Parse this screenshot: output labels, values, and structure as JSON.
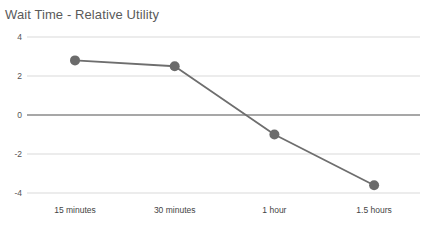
{
  "chart_data": {
    "type": "line",
    "title": "Wait Time - Relative Utility",
    "xlabel": "",
    "ylabel": "",
    "categories": [
      "15 minutes",
      "30 minutes",
      "1 hour",
      "1.5 hours"
    ],
    "values": [
      2.8,
      2.5,
      -1.0,
      -3.6
    ],
    "series": [
      {
        "name": "Relative Utility",
        "values": [
          2.8,
          2.5,
          -1.0,
          -3.6
        ]
      }
    ],
    "ylim": [
      -4,
      4
    ],
    "yticks": [
      4,
      2,
      0,
      -2,
      -4
    ],
    "ytick_labels": [
      "4",
      "2",
      "0",
      "-2",
      "-4"
    ],
    "grid": true,
    "legend": "none",
    "colors": {
      "line": "#6e6e6e",
      "marker": "#6b6b6b",
      "gridline": "#d9d9d9",
      "zero_line": "#8a8a8a",
      "title_text": "#5a5a5a",
      "tick_text": "#4d4d4d",
      "background": "#ffffff"
    }
  }
}
